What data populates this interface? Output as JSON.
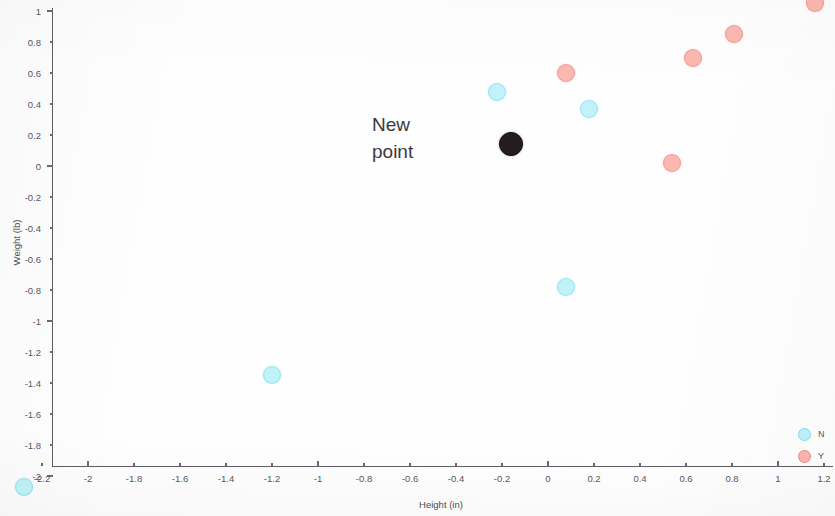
{
  "chart_data": {
    "type": "scatter",
    "title": "",
    "xlabel": "Height (in)",
    "ylabel": "Weight (lb)",
    "xlim": [
      -2.35,
      1.35
    ],
    "ylim": [
      -2.12,
      1.12
    ],
    "grid": false,
    "legend_position": "bottom-right",
    "xticks": [
      -2.2,
      -2,
      -1.8,
      -1.6,
      -1.4,
      -1.2,
      -1,
      -0.8,
      -0.6,
      -0.4,
      -0.2,
      0,
      0.2,
      0.4,
      0.6,
      0.8,
      1,
      1.2
    ],
    "xticklabels": [
      "-2.2",
      "-2",
      "-1.8",
      "-1.6",
      "-1.4",
      "-1.2",
      "-1",
      "-0.8",
      "-0.6",
      "-0.4",
      "-0.2",
      "0",
      "0.2",
      "0.4",
      "0.6",
      "0.8",
      "1",
      "1.2"
    ],
    "yticks": [
      1,
      0.8,
      0.6,
      0.4,
      0.2,
      0,
      -0.2,
      -0.4,
      -0.6,
      -0.8,
      -1,
      -1.2,
      -1.4,
      -1.6,
      -1.8,
      -2
    ],
    "yticklabels": [
      "1",
      "0.8",
      "0.6",
      "0.4",
      "0.2",
      "0",
      "-0.2",
      "-0.4",
      "-0.6",
      "-0.8",
      "-1",
      "-1.2",
      "-1.4",
      "-1.6",
      "-1.8",
      "-2"
    ],
    "series": [
      {
        "name": "N",
        "color": "#afeef8",
        "marker": "circle",
        "points": [
          {
            "x": -2.28,
            "y": -2.07
          },
          {
            "x": -1.2,
            "y": -1.35
          },
          {
            "x": 0.08,
            "y": -0.78
          },
          {
            "x": -0.22,
            "y": 0.48
          },
          {
            "x": 0.18,
            "y": 0.37
          }
        ]
      },
      {
        "name": "Y",
        "color": "#f9a8a0",
        "marker": "circle",
        "points": [
          {
            "x": 0.08,
            "y": 0.6
          },
          {
            "x": 0.54,
            "y": 0.02
          },
          {
            "x": 0.63,
            "y": 0.7
          },
          {
            "x": 0.81,
            "y": 0.85
          },
          {
            "x": 1.16,
            "y": 1.05
          }
        ]
      },
      {
        "name": "New point",
        "color": "#241d20",
        "marker": "circle",
        "points": [
          {
            "x": -0.16,
            "y": 0.14
          }
        ]
      }
    ],
    "annotations": [
      {
        "text_lines": [
          "New",
          "point"
        ],
        "x": -0.93,
        "y": 0.33
      }
    ]
  },
  "axes": {
    "x_title": "Height (in)",
    "y_title": "Weight (lb)"
  },
  "annotation": {
    "line1": "New",
    "line2": "point"
  },
  "legend": {
    "items": [
      {
        "label": "N",
        "color": "#afeef8"
      },
      {
        "label": "Y",
        "color": "#f9a8a0"
      }
    ]
  }
}
